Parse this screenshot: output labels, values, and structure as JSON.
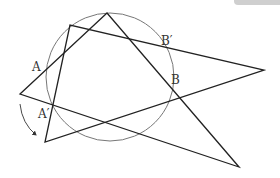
{
  "figure": {
    "circle": {
      "cx": 110,
      "cy": 77,
      "r": 64,
      "stroke": "#777777"
    },
    "triangle_1": {
      "label": "original triangle",
      "points": [
        [
          107,
          13
        ],
        [
          20,
          94
        ],
        [
          239,
          167
        ]
      ]
    },
    "triangle_2": {
      "label": "rotated triangle",
      "points": [
        [
          70,
          25
        ],
        [
          45,
          142
        ],
        [
          264,
          70
        ]
      ]
    },
    "rotation_arrow": {
      "direction": "counterclockwise-down",
      "from": [
        20,
        104
      ],
      "to": [
        36,
        135
      ]
    },
    "labels": [
      {
        "text": "A",
        "x": 32,
        "y": 71
      },
      {
        "text": "A′",
        "x": 38,
        "y": 118
      },
      {
        "text": "B′",
        "x": 161,
        "y": 45
      },
      {
        "text": "B",
        "x": 171,
        "y": 84
      }
    ],
    "line_color": "#222222"
  }
}
